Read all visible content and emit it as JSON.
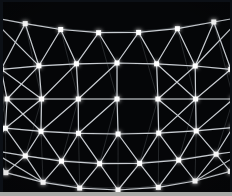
{
  "image": {
    "title": "Geodesic Lattice Mesh",
    "subject": "curved triangular grid of illuminated nodes on black background",
    "width": 232,
    "height": 196,
    "background_color": "#050608",
    "node_color": "#ffffff",
    "edge_color": "#c9cdd2",
    "border_color": "#0c1016",
    "bottom_strip_color": "#a8a9a6"
  },
  "chart_data": {
    "type": "scatter",
    "xlabel": "",
    "ylabel": "",
    "xlim": [
      0,
      232
    ],
    "ylim": [
      0,
      196
    ],
    "grid": true,
    "legend": "none",
    "rows": [
      {
        "name": "row-0",
        "y_center": 33,
        "y_edge": 17,
        "x": [
          -8,
          27,
          62,
          99,
          138,
          176,
          212,
          240
        ],
        "offset": 0
      },
      {
        "name": "row-1",
        "y_center": 63,
        "y_edge": 70,
        "x": [
          6,
          42,
          78,
          117,
          155,
          192,
          226
        ],
        "offset": 1
      },
      {
        "name": "row-2",
        "y_center": 99,
        "y_edge": 99,
        "x": [
          12,
          45,
          80,
          117,
          156,
          192,
          228
        ],
        "offset": 0
      },
      {
        "name": "row-3",
        "y_center": 134,
        "y_edge": 127,
        "x": [
          10,
          44,
          80,
          118,
          157,
          193,
          228
        ],
        "offset": 1
      },
      {
        "name": "row-4",
        "y_center": 164,
        "y_edge": 150,
        "x": [
          -6,
          28,
          63,
          100,
          139,
          177,
          213,
          242
        ],
        "offset": 0
      },
      {
        "name": "row-5",
        "y_center": 190,
        "y_edge": 170,
        "x": [
          8,
          44,
          80,
          118,
          158,
          194,
          228
        ],
        "offset": 1
      }
    ],
    "node_count": 44,
    "node_size_px": 5,
    "edge_width_px": 1.2
  },
  "render": {
    "node_glow_radius": 4,
    "curvature_amplitude": 16
  }
}
